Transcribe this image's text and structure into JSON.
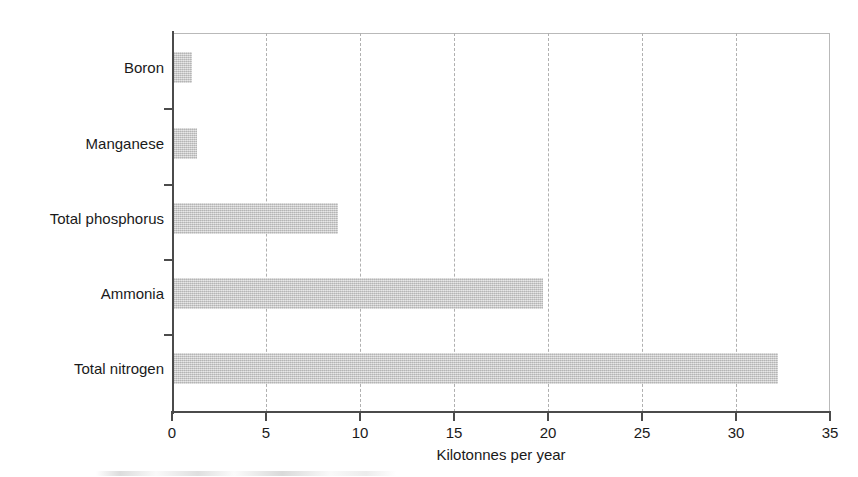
{
  "chart_data": {
    "type": "bar",
    "orientation": "horizontal",
    "title": "",
    "subtitle": "",
    "xlabel": "Kilotonnes per year",
    "ylabel": "",
    "categories": [
      "Boron",
      "Manganese",
      "Total phosphorus",
      "Ammonia",
      "Total nitrogen"
    ],
    "values": [
      1.0,
      1.3,
      8.8,
      19.7,
      32.2
    ],
    "xlim": [
      0,
      35
    ],
    "xticks": [
      0,
      5,
      10,
      15,
      20,
      25,
      30,
      35
    ],
    "xtick_labels": [
      "0",
      "5",
      "10",
      "15",
      "20",
      "25",
      "30",
      "35"
    ],
    "grid": {
      "vertical": true,
      "horizontal": false,
      "style": "dashed",
      "at": [
        5,
        10,
        15,
        20,
        25,
        30
      ]
    },
    "legend": {
      "visible": false,
      "position": "none",
      "entries": []
    },
    "series": [
      {
        "name": "Load",
        "values": [
          1.0,
          1.3,
          8.8,
          19.7,
          32.2
        ]
      }
    ],
    "bars": [
      {
        "category": "Boron",
        "value": 1.0
      },
      {
        "category": "Manganese",
        "value": 1.3
      },
      {
        "category": "Total phosphorus",
        "value": 8.8
      },
      {
        "category": "Ammonia",
        "value": 19.7
      },
      {
        "category": "Total nitrogen",
        "value": 32.2
      }
    ],
    "annotations": [],
    "colors": {
      "bar_fill": "#c9c9c9",
      "axis": "#4b4b4b",
      "gridline": "#b0b0b0",
      "plot_border": "#b9b9b9",
      "text": "#1a1a1a",
      "background": "#ffffff"
    }
  }
}
